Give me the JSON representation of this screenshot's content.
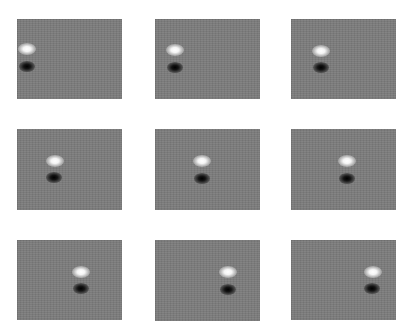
{
  "figure": {
    "layout": {
      "rows": 3,
      "cols": 3
    },
    "background_color": "#7b7b7b",
    "panels": [
      {
        "id": 1,
        "x": 17,
        "y": 19,
        "w": 105,
        "h": 80,
        "white_blob": {
          "cx": 10,
          "cy": 30
        },
        "dark_blob": {
          "cx": 10,
          "cy": 47
        }
      },
      {
        "id": 2,
        "x": 155,
        "y": 19,
        "w": 105,
        "h": 80,
        "white_blob": {
          "cx": 20,
          "cy": 31
        },
        "dark_blob": {
          "cx": 20,
          "cy": 48
        }
      },
      {
        "id": 3,
        "x": 291,
        "y": 19,
        "w": 105,
        "h": 80,
        "white_blob": {
          "cx": 30,
          "cy": 32
        },
        "dark_blob": {
          "cx": 30,
          "cy": 48
        }
      },
      {
        "id": 4,
        "x": 17,
        "y": 129,
        "w": 105,
        "h": 81,
        "white_blob": {
          "cx": 38,
          "cy": 32
        },
        "dark_blob": {
          "cx": 37,
          "cy": 48
        }
      },
      {
        "id": 5,
        "x": 155,
        "y": 129,
        "w": 105,
        "h": 81,
        "white_blob": {
          "cx": 47,
          "cy": 32
        },
        "dark_blob": {
          "cx": 47,
          "cy": 49
        }
      },
      {
        "id": 6,
        "x": 291,
        "y": 129,
        "w": 105,
        "h": 81,
        "white_blob": {
          "cx": 56,
          "cy": 32
        },
        "dark_blob": {
          "cx": 56,
          "cy": 49
        }
      },
      {
        "id": 7,
        "x": 17,
        "y": 240,
        "w": 105,
        "h": 80,
        "white_blob": {
          "cx": 64,
          "cy": 32
        },
        "dark_blob": {
          "cx": 64,
          "cy": 48
        }
      },
      {
        "id": 8,
        "x": 155,
        "y": 240,
        "w": 105,
        "h": 81,
        "white_blob": {
          "cx": 73,
          "cy": 32
        },
        "dark_blob": {
          "cx": 73,
          "cy": 49
        }
      },
      {
        "id": 9,
        "x": 291,
        "y": 240,
        "w": 105,
        "h": 80,
        "white_blob": {
          "cx": 82,
          "cy": 32
        },
        "dark_blob": {
          "cx": 81,
          "cy": 48
        }
      }
    ]
  }
}
